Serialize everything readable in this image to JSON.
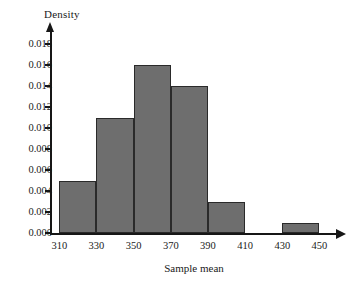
{
  "chart_data": {
    "type": "bar",
    "title": "",
    "subtitle": "",
    "xlabel": "Sample mean",
    "ylabel": "Density",
    "grid": false,
    "legend": "none",
    "xlim": [
      305,
      460
    ],
    "ylim": [
      0.0,
      0.019
    ],
    "x_ticks": [
      "310",
      "330",
      "350",
      "370",
      "390",
      "410",
      "430",
      "450"
    ],
    "x_tick_values": [
      310,
      330,
      350,
      370,
      390,
      410,
      430,
      450
    ],
    "y_ticks": [
      "0.000",
      "0.002",
      "0.004",
      "0.006",
      "0.008",
      "0.010",
      "0.012",
      "0.014",
      "0.016",
      "0.018"
    ],
    "y_tick_values": [
      0.0,
      0.002,
      0.004,
      0.006,
      0.008,
      0.01,
      0.012,
      0.014,
      0.016,
      0.018
    ],
    "bin_width": 20,
    "categories": [
      "310-330",
      "330-350",
      "350-370",
      "370-390",
      "390-410",
      "410-430",
      "430-450"
    ],
    "bins": [
      {
        "x0": 310,
        "x1": 330,
        "value": 0.005
      },
      {
        "x0": 330,
        "x1": 350,
        "value": 0.011
      },
      {
        "x0": 350,
        "x1": 370,
        "value": 0.016
      },
      {
        "x0": 370,
        "x1": 390,
        "value": 0.014
      },
      {
        "x0": 390,
        "x1": 410,
        "value": 0.003
      },
      {
        "x0": 410,
        "x1": 430,
        "value": 0.0
      },
      {
        "x0": 430,
        "x1": 450,
        "value": 0.001
      }
    ],
    "values": [
      0.005,
      0.011,
      0.016,
      0.014,
      0.003,
      0.0,
      0.001
    ],
    "colors": {
      "bar_fill": "#6e6e6e",
      "bar_edge": "#2a2a2a",
      "axis": "#171717",
      "text": "#1a1a1a",
      "background": "#ffffff"
    }
  }
}
